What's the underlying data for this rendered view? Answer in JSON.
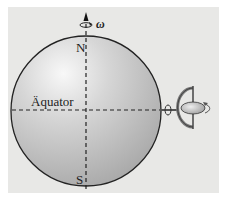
{
  "figure": {
    "labels": {
      "north": "N",
      "south": "S",
      "equator": "Äquator",
      "omega": "ω"
    },
    "elements": [
      "earth-sphere",
      "rotation-axis",
      "equator-line",
      "gyroscope"
    ],
    "colors": {
      "background": "#e8e8e6",
      "sphere_light": "#f4f4f4",
      "sphere_dark": "#a9a9a9",
      "outline": "#222222"
    }
  }
}
